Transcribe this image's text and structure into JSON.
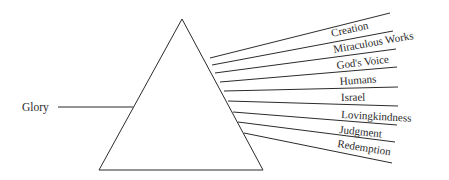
{
  "diagram": {
    "type": "prism",
    "input": {
      "label": "Glory"
    },
    "outputs": [
      {
        "label": "Creation"
      },
      {
        "label": "Miraculous Works"
      },
      {
        "label": "God's Voice"
      },
      {
        "label": "Humans"
      },
      {
        "label": "Israel"
      },
      {
        "label": "Lovingkindness"
      },
      {
        "label": "Judgment"
      },
      {
        "label": "Redemption"
      }
    ]
  }
}
